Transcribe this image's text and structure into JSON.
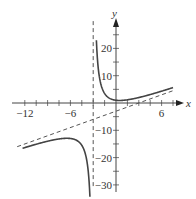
{
  "chart_data": {
    "type": "line",
    "title": "",
    "xlabel": "x",
    "ylabel": "y",
    "xlim": [
      -13,
      8
    ],
    "ylim": [
      -31,
      30
    ],
    "grid": false,
    "x_ticks": [
      -12,
      -6,
      6
    ],
    "x_tick_labels": [
      "−12",
      "−6",
      "6"
    ],
    "x_minor_tick_step": 1.5,
    "y_ticks": [
      20,
      10,
      -10,
      -20,
      -30
    ],
    "y_tick_labels": [
      "20",
      "10",
      "−10",
      "−20",
      "−30"
    ],
    "y_minor_tick_step": 5,
    "function": "y = x - 3 + 12/(x + 3)",
    "series": [
      {
        "name": "curve-left-branch",
        "style": "solid",
        "x": [
          -13,
          -12,
          -10,
          -8,
          -7,
          -6,
          -5,
          -4.5,
          -4,
          -3.7,
          -3.45
        ],
        "y": [
          -17.2,
          -16.3,
          -14.7,
          -13.4,
          -13.0,
          -13.0,
          -14.0,
          -15.5,
          -19.0,
          -23.8,
          -33.1
        ]
      },
      {
        "name": "curve-right-branch",
        "style": "solid",
        "x": [
          -2.6,
          -2.5,
          -2,
          -1,
          0,
          1,
          2,
          4,
          6,
          7.5
        ],
        "y": [
          24.4,
          18.5,
          7.0,
          2.0,
          1.0,
          1.0,
          1.4,
          2.7,
          4.3,
          7.2
        ]
      },
      {
        "name": "vertical-asymptote",
        "style": "dashed",
        "x": [
          -3,
          -3
        ],
        "y": [
          30,
          -31
        ]
      },
      {
        "name": "slant-asymptote",
        "style": "dashed",
        "x": [
          -13,
          7.5
        ],
        "y": [
          -16,
          4.5
        ]
      }
    ],
    "annotations": []
  },
  "axes": {
    "x_label": "x",
    "y_label": "y"
  }
}
